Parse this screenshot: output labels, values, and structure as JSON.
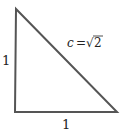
{
  "diagram": {
    "type": "right-triangle",
    "vertices": {
      "top": [
        16,
        9
      ],
      "right_angle": [
        15,
        112
      ],
      "right": [
        117,
        112
      ]
    },
    "stroke_color": "#555555",
    "labels": {
      "left_side": "1",
      "bottom_side": "1",
      "hypotenuse_var": "c",
      "equals": "=",
      "sqrt_symbol": "√",
      "radicand": "2"
    }
  }
}
